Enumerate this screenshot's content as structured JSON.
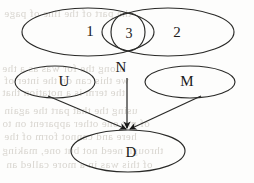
{
  "figure": {
    "type": "venn-and-causal-diagram",
    "background_color": "#fdfdfc",
    "ink_color": "#1a1a1a",
    "ghost_text_color": "#cfcbc4",
    "width": 254,
    "height": 183
  },
  "nodes": {
    "region_one": {
      "label": "1",
      "shape": "ellipse",
      "cx": 88,
      "cy": 32,
      "rx": 66,
      "ry": 24
    },
    "region_two": {
      "label": "2",
      "shape": "ellipse",
      "cx": 168,
      "cy": 32,
      "rx": 66,
      "ry": 24
    },
    "region_three": {
      "label": "3",
      "shape": "ellipse",
      "cx": 128,
      "cy": 32,
      "rx": 17,
      "ry": 19
    },
    "node_u": {
      "label": "U",
      "shape": "ellipse",
      "cx": 55,
      "cy": 82,
      "rx": 40,
      "ry": 16
    },
    "node_m": {
      "label": "M",
      "shape": "ellipse",
      "cx": 190,
      "cy": 82,
      "rx": 45,
      "ry": 16
    },
    "node_n": {
      "label": "N",
      "shape": "text",
      "cx": 121,
      "cy": 67
    },
    "node_d": {
      "label": "D",
      "shape": "ellipse",
      "cx": 128,
      "cy": 151,
      "rx": 57,
      "ry": 21
    }
  },
  "label_positions": {
    "one": {
      "x": 90,
      "y": 31
    },
    "two": {
      "x": 177,
      "y": 32
    },
    "three": {
      "x": 129,
      "y": 34
    },
    "u": {
      "x": 64,
      "y": 81
    },
    "m": {
      "x": 187,
      "y": 81
    },
    "n": {
      "x": 121,
      "y": 67
    },
    "d": {
      "x": 131,
      "y": 152
    }
  },
  "edges": [
    {
      "name": "u-to-d",
      "from": "U",
      "to": "D",
      "x1": 48,
      "y1": 96,
      "x2": 127,
      "y2": 130,
      "arrow": true
    },
    {
      "name": "n-to-d",
      "from": "N",
      "to": "D",
      "x1": 127,
      "y1": 78,
      "x2": 127,
      "y2": 130,
      "arrow": true
    },
    {
      "name": "m-to-d",
      "from": "M",
      "to": "D",
      "x1": 201,
      "y1": 96,
      "x2": 129,
      "y2": 130,
      "arrow": true
    }
  ],
  "ghost_text": {
    "note": "faint mirrored bleed-through text from reverse side of scanned page",
    "lines": [
      {
        "text": "the part of the line of page",
        "x": 4,
        "y": 7
      },
      {
        "text": "along the for was as a the",
        "x": 2,
        "y": 62
      },
      {
        "text": "we this can on the inter of",
        "x": 4,
        "y": 74
      },
      {
        "text": "the term is a notation that",
        "x": 2,
        "y": 86
      },
      {
        "text": "using the that part the again",
        "x": 4,
        "y": 104
      },
      {
        "text": "of my one other apparent on to",
        "x": 2,
        "y": 117
      },
      {
        "text": "here and cannot form of the",
        "x": 4,
        "y": 130
      },
      {
        "text": "through need not but one, making",
        "x": 2,
        "y": 144
      },
      {
        "text": "of this was in a more called an",
        "x": 6,
        "y": 158
      }
    ]
  }
}
